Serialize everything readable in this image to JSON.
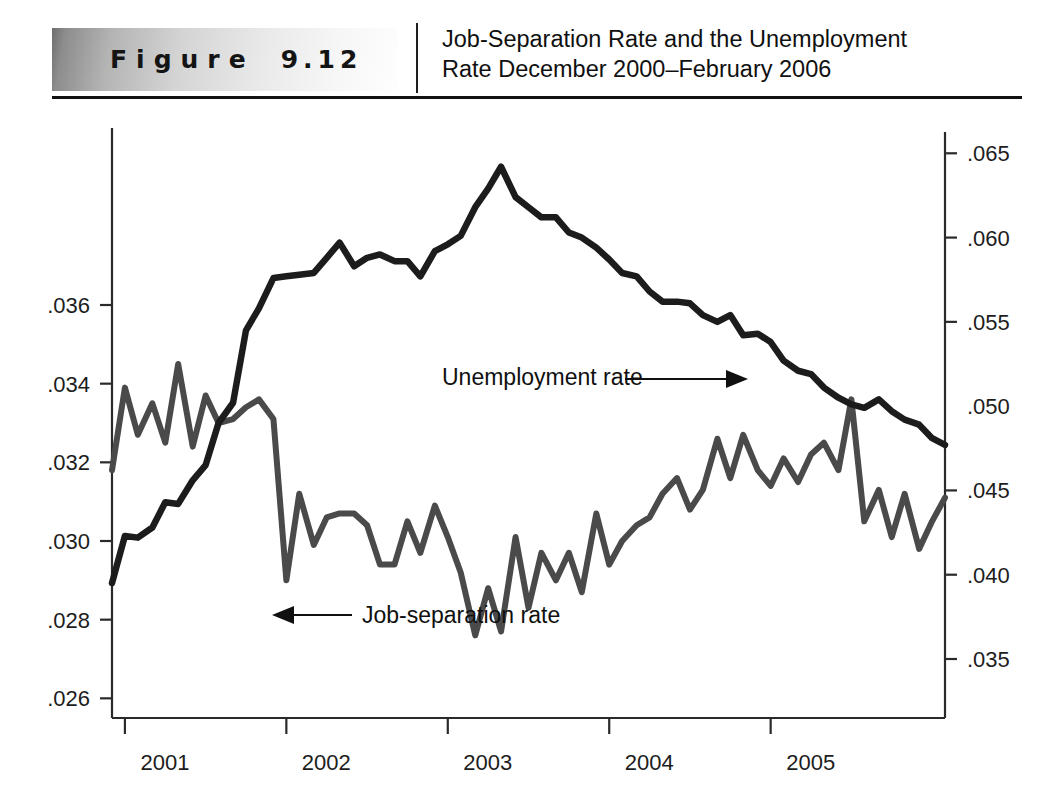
{
  "header": {
    "badge_word": "Figure",
    "badge_number": "9.12",
    "title_line1": "Job-Separation Rate and the Unemployment",
    "title_line2": "Rate December 2000–February 2006"
  },
  "colors": {
    "separation_line": "#4a4a4a",
    "unemployment_line": "#1c1c1c",
    "axis": "#2a2a2a",
    "text": "#1a1a1a",
    "background": "#ffffff"
  },
  "chart_data": {
    "type": "line",
    "title": "Job-Separation Rate and the Unemployment Rate December 2000–February 2006",
    "xlabel": "",
    "ylabel": "",
    "grid": false,
    "legend_position": "inline-annotation",
    "x_tick_labels": [
      "2001",
      "2002",
      "2003",
      "2004",
      "2005"
    ],
    "x_tick_values": [
      2001,
      2002,
      2003,
      2004,
      2005
    ],
    "xlim": [
      2000.92,
      2006.08
    ],
    "left_axis": {
      "name": "Job-separation rate",
      "ticks": [
        ".026",
        ".028",
        ".030",
        ".032",
        ".034",
        ".036"
      ],
      "tick_values": [
        0.026,
        0.028,
        0.03,
        0.032,
        0.034,
        0.036
      ],
      "ylim": [
        0.0255,
        0.0405
      ]
    },
    "right_axis": {
      "name": "Unemployment rate",
      "ticks": [
        ".035",
        ".040",
        ".045",
        ".050",
        ".055",
        ".060",
        ".065"
      ],
      "tick_values": [
        0.035,
        0.04,
        0.045,
        0.05,
        0.055,
        0.06,
        0.065
      ],
      "ylim": [
        0.0315,
        0.0665
      ]
    },
    "x": [
      2000.92,
      2001.0,
      2001.08,
      2001.17,
      2001.25,
      2001.33,
      2001.42,
      2001.5,
      2001.58,
      2001.67,
      2001.75,
      2001.83,
      2001.92,
      2002.0,
      2002.08,
      2002.17,
      2002.25,
      2002.33,
      2002.42,
      2002.5,
      2002.58,
      2002.67,
      2002.75,
      2002.83,
      2002.92,
      2003.0,
      2003.08,
      2003.17,
      2003.25,
      2003.33,
      2003.42,
      2003.5,
      2003.58,
      2003.67,
      2003.75,
      2003.83,
      2003.92,
      2004.0,
      2004.08,
      2004.17,
      2004.25,
      2004.33,
      2004.42,
      2004.5,
      2004.58,
      2004.67,
      2004.75,
      2004.83,
      2004.92,
      2005.0,
      2005.08,
      2005.17,
      2005.25,
      2005.33,
      2005.42,
      2005.5,
      2005.58,
      2005.67,
      2005.75,
      2005.83,
      2005.92,
      2006.0,
      2006.08
    ],
    "series": [
      {
        "name": "Job-separation rate",
        "axis": "left",
        "color": "#4a4a4a",
        "values": [
          0.0318,
          0.0339,
          0.0327,
          0.0335,
          0.0325,
          0.0345,
          0.0324,
          0.0337,
          0.033,
          0.0331,
          0.0334,
          0.0336,
          0.0331,
          0.029,
          0.0312,
          0.0299,
          0.0306,
          0.0307,
          0.0307,
          0.0304,
          0.0294,
          0.0294,
          0.0305,
          0.0297,
          0.0309,
          0.0301,
          0.0292,
          0.0276,
          0.0288,
          0.0277,
          0.0301,
          0.0283,
          0.0297,
          0.029,
          0.0297,
          0.0287,
          0.0307,
          0.0294,
          0.03,
          0.0304,
          0.0306,
          0.0312,
          0.0316,
          0.0308,
          0.0313,
          0.0326,
          0.0316,
          0.0327,
          0.0318,
          0.0314,
          0.0321,
          0.0315,
          0.0322,
          0.0325,
          0.0318,
          0.0336,
          0.0305,
          0.0313,
          0.0301,
          0.0312,
          0.0298,
          0.0305,
          0.0311
        ]
      },
      {
        "name": "Unemployment rate",
        "axis": "right",
        "color": "#1c1c1c",
        "values": [
          0.0395,
          0.0423,
          0.0422,
          0.0428,
          0.0443,
          0.0442,
          0.0456,
          0.0465,
          0.049,
          0.0502,
          0.0545,
          0.0558,
          0.0576,
          0.0577,
          0.0578,
          0.0579,
          0.0588,
          0.0597,
          0.0583,
          0.0588,
          0.059,
          0.0586,
          0.0586,
          0.0577,
          0.0592,
          0.0596,
          0.0601,
          0.0618,
          0.0629,
          0.0642,
          0.0624,
          0.0618,
          0.0612,
          0.0612,
          0.0603,
          0.06,
          0.0594,
          0.0587,
          0.0579,
          0.0577,
          0.0568,
          0.0562,
          0.0562,
          0.0561,
          0.0554,
          0.055,
          0.0554,
          0.0542,
          0.0543,
          0.0538,
          0.0527,
          0.0521,
          0.0519,
          0.0511,
          0.0505,
          0.0501,
          0.0499,
          0.0504,
          0.0497,
          0.0492,
          0.0489,
          0.0481,
          0.0477
        ]
      }
    ],
    "annotations": [
      {
        "id": "unemployment-annotation",
        "text": "Unemployment rate",
        "text_x": 442,
        "text_y": 285,
        "arrow_from_x": 625,
        "arrow_from_y": 279,
        "arrow_to_x": 748,
        "arrow_to_y": 279
      },
      {
        "id": "separation-annotation",
        "text": "Job-separation rate",
        "text_x": 362,
        "text_y": 523,
        "arrow_from_x": 352,
        "arrow_from_y": 515,
        "arrow_to_x": 272,
        "arrow_to_y": 515
      }
    ]
  }
}
